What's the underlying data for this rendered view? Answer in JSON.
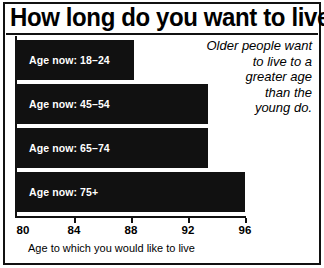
{
  "chart_data": {
    "type": "bar",
    "orientation": "horizontal",
    "title": "How long do you want to live?",
    "xlabel": "Age to which you would like to live",
    "ylabel": "",
    "xlim": [
      80,
      96
    ],
    "xticks": [
      80,
      84,
      88,
      92,
      96
    ],
    "xtick_labels": [
      "80",
      "84",
      "88",
      "92",
      "96"
    ],
    "grid": false,
    "legend": false,
    "categories": [
      "Age now: 18–24",
      "Age now: 45–54",
      "Age now: 65–74",
      "Age now: 75+"
    ],
    "values": [
      88.2,
      93.4,
      93.4,
      96.0
    ],
    "bar_color": "#111111",
    "background_color": "#ffffff",
    "annotation": "Older people want to live to a greater age than the young do.",
    "annotation_lines": [
      "Older people want",
      "to live to a",
      "greater age",
      "than the",
      "young do."
    ],
    "bars": [
      {
        "label": "Age now: 18–24",
        "value": 88.2
      },
      {
        "label": "Age now: 45–54",
        "value": 93.4
      },
      {
        "label": "Age now: 65–74",
        "value": 93.4
      },
      {
        "label": "Age now: 75+",
        "value": 96.0
      }
    ]
  }
}
